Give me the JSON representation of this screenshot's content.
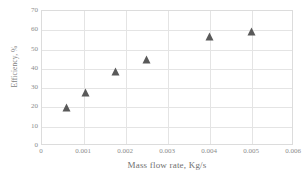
{
  "chart_data": {
    "type": "scatter",
    "title": "",
    "xlabel": "Mass flow rate, Kg/s",
    "ylabel": "Efficiency, %",
    "xlim": [
      0,
      0.006
    ],
    "ylim": [
      0,
      70
    ],
    "xticks": [
      "0",
      "0.001",
      "0.002",
      "0.003",
      "0.004",
      "0.005",
      "0.006"
    ],
    "xtick_values": [
      0,
      0.001,
      0.002,
      0.003,
      0.004,
      0.005,
      0.006
    ],
    "yticks": [
      "0",
      "10",
      "20",
      "30",
      "40",
      "50",
      "60",
      "70"
    ],
    "ytick_values": [
      0,
      10,
      20,
      30,
      40,
      50,
      60,
      70
    ],
    "grid": true,
    "legend": false,
    "marker": "triangle",
    "marker_color": "#595959",
    "series": [
      {
        "name": "Efficiency",
        "x": [
          0.0006,
          0.00105,
          0.00175,
          0.0025,
          0.004,
          0.005
        ],
        "y": [
          19,
          27,
          38,
          44,
          56,
          58.5
        ]
      }
    ]
  },
  "axes": {
    "y_title": "Efficiency, %",
    "x_title": "Mass flow rate, Kg/s"
  }
}
